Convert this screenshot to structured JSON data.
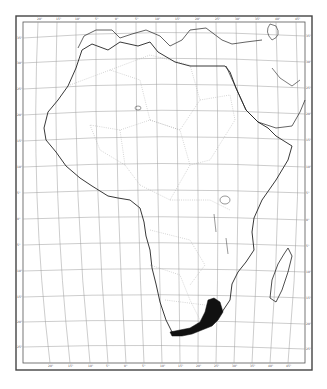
{
  "map": {
    "subject": "Africa",
    "type": "distribution map",
    "colors": {
      "background": "#ffffff",
      "frame": "#444444",
      "graticule": "#9a9a9a",
      "coast": "#222222",
      "border": "#aaaaaa",
      "range_fill": "#111111"
    },
    "frame": {
      "outer": {
        "x": 16,
        "y": 16,
        "w": 296,
        "h": 354
      },
      "inner": {
        "x": 23,
        "y": 22,
        "w": 282,
        "h": 341
      }
    },
    "top_tick_labels": [
      "20°",
      "15°",
      "10°",
      "5°",
      "0°",
      "5°",
      "10°",
      "15°",
      "20°",
      "25°",
      "30°",
      "35°",
      "40°",
      "45°",
      "50°"
    ],
    "bottom_tick_labels": [
      "20°",
      "15°",
      "10°",
      "5°",
      "0°",
      "5°",
      "10°",
      "15°",
      "20°",
      "25°",
      "30°",
      "35°",
      "40°",
      "45°"
    ],
    "left_tick_labels": [
      "35°",
      "30°",
      "25°",
      "20°",
      "15°",
      "10°",
      "5°",
      "0°",
      "5°",
      "10°",
      "15°",
      "20°",
      "25°",
      "30°",
      "35°"
    ],
    "right_tick_labels": [
      "35°",
      "30°",
      "25°",
      "20°",
      "15°",
      "10°",
      "5°",
      "0°",
      "5°",
      "10°",
      "15°",
      "20°",
      "25°",
      "30°",
      "35°"
    ],
    "highlighted_range": "southeastern South Africa (Eastern Cape to KwaZulu-Natal coast)"
  }
}
